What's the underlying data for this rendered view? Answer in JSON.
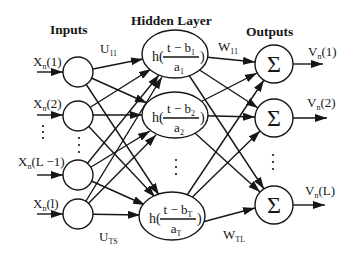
{
  "diagram": {
    "type": "neural-network",
    "titles": {
      "inputs": "Inputs",
      "hidden": "Hidden Layer",
      "outputs": "Outputs"
    },
    "inputs": [
      {
        "var": "X",
        "sub": "n",
        "arg": "(1)"
      },
      {
        "var": "X",
        "sub": "n",
        "arg": "(2)"
      },
      {
        "var": "X",
        "sub": "n",
        "arg": "(L −1)"
      },
      {
        "var": "X",
        "sub": "n",
        "arg": "(l)"
      }
    ],
    "hidden": [
      {
        "func": "h(",
        "num": "t − b",
        "num_sub": "1",
        "den": "a",
        "den_sub": "1",
        "close": ")"
      },
      {
        "func": "h(",
        "num": "t − b",
        "num_sub": "2",
        "den": "a",
        "den_sub": "2",
        "close": ")"
      },
      {
        "func": "h(",
        "num": "t − b",
        "num_sub": "T",
        "den": "a",
        "den_sub": "T",
        "close": ")"
      }
    ],
    "outputs": [
      {
        "symbol": "Σ",
        "var": "V",
        "sub": "n",
        "arg": "(1)"
      },
      {
        "symbol": "Σ",
        "var": "V",
        "sub": "n",
        "arg": "(2)"
      },
      {
        "symbol": "Σ",
        "var": "V",
        "sub": "n",
        "arg": "(L)"
      }
    ],
    "weights": {
      "input_hidden_first": {
        "var": "U",
        "sub": "11"
      },
      "input_hidden_last": {
        "var": "U",
        "sub": "TS"
      },
      "hidden_output_first": {
        "var": "W",
        "sub": "11"
      },
      "hidden_output_last": {
        "var": "W",
        "sub": "TL"
      }
    },
    "edges": {
      "input_to_hidden": "fully-connected",
      "hidden_to_output": "fully-connected"
    },
    "colors": {
      "stroke": "#161616",
      "background": "#ffffff"
    }
  }
}
